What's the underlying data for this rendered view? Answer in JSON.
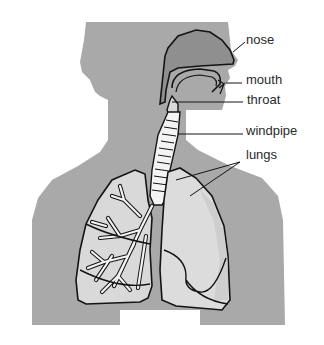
{
  "diagram": {
    "labels": {
      "nose": "nose",
      "mouth": "mouth",
      "throat": "throat",
      "windpipe": "windpipe",
      "lungs": "lungs"
    },
    "colors": {
      "background": "#ffffff",
      "silhouette": "#a9a9a9",
      "nasal_cavity": "#8f8f8f",
      "lung_fill": "#d9d9d9",
      "bronchi": "#f4f4f4",
      "outline": "#141414",
      "label_text": "#2a2a2a"
    }
  }
}
